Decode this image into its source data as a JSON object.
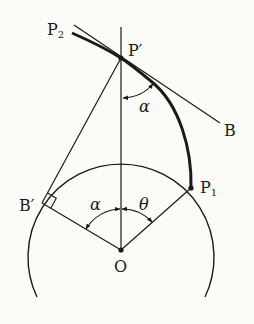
{
  "diagram": {
    "type": "geometry",
    "colors": {
      "background": "#fbfbf8",
      "ink": "#1a1a1a"
    },
    "labels": {
      "P2": {
        "main": "P",
        "sub": "2"
      },
      "P_prime": "P′",
      "B": "B",
      "P1": {
        "main": "P",
        "sub": "1"
      },
      "B_prime": "B′",
      "O": "O",
      "alpha_top": "α",
      "alpha_center": "α",
      "theta": "θ"
    },
    "points": {
      "O": [
        121,
        250
      ],
      "P_prime": [
        121,
        58
      ],
      "P1": [
        191,
        188
      ],
      "B_prime": [
        42,
        203
      ],
      "B_end": [
        220,
        123
      ],
      "P2_end": [
        72,
        33
      ]
    },
    "circle_radius": 93
  }
}
